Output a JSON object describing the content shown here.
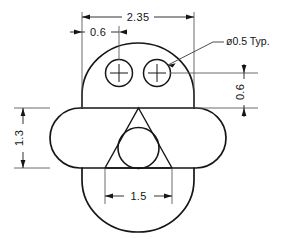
{
  "drawing": {
    "title": "Mechanical part orthographic view",
    "units_note": "",
    "line_color": "#161616",
    "dim_color": "#141414",
    "background": "#ffffff",
    "dimensions": [
      {
        "id": "overall-width",
        "label": "2.35",
        "orientation": "horizontal",
        "position": "top"
      },
      {
        "id": "hole-offset",
        "label": "0.6",
        "orientation": "horizontal",
        "position": "top-left"
      },
      {
        "id": "hole-height",
        "label": "0.6",
        "orientation": "vertical",
        "position": "right"
      },
      {
        "id": "slot-height",
        "label": "1.3",
        "orientation": "vertical",
        "position": "left"
      },
      {
        "id": "triangle-base",
        "label": "1.5",
        "orientation": "horizontal",
        "position": "bottom"
      }
    ],
    "notes": [
      {
        "id": "hole-diameter-note",
        "label": "ø0.5 Typ."
      }
    ],
    "features": {
      "upper_dome": "arc",
      "horizontal_slot": "obround",
      "lower_arc": "arc",
      "holes": 2,
      "triangle": "equilateral",
      "inscribed_circle": "circle"
    }
  }
}
